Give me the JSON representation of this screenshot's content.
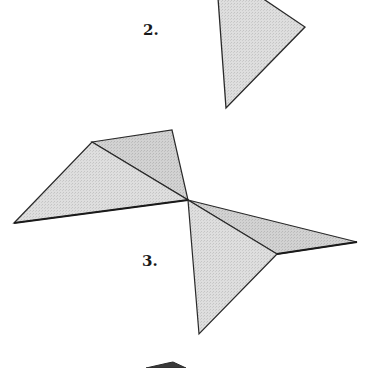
{
  "labels": {
    "figure2": "2.",
    "figure3": "3."
  },
  "colors": {
    "fill": "#dcdcdc",
    "fill_dark": "#cfcfcf",
    "stroke": "#2a2a2a",
    "background": "#ffffff"
  },
  "figures": [
    {
      "id": "figure-2",
      "label": "2.",
      "shape": "triangle",
      "points": [
        [
          218,
          0
        ],
        [
          262,
          0
        ],
        [
          305,
          27
        ],
        [
          226,
          108
        ]
      ]
    },
    {
      "id": "figure-3",
      "label": "3.",
      "shape": "pinwheel-of-triangles",
      "center": [
        188,
        200
      ],
      "triangles": [
        {
          "name": "upper-left-large",
          "points": [
            [
              14,
              223
            ],
            [
              92,
              142
            ],
            [
              188,
              200
            ]
          ]
        },
        {
          "name": "upper-left-small",
          "points": [
            [
              92,
              142
            ],
            [
              172,
              130
            ],
            [
              188,
              200
            ]
          ]
        },
        {
          "name": "lower-right-small",
          "points": [
            [
              188,
              200
            ],
            [
              357,
              242
            ],
            [
              277,
              254
            ]
          ]
        },
        {
          "name": "lower-right-large",
          "points": [
            [
              188,
              200
            ],
            [
              277,
              254
            ],
            [
              199,
              334
            ]
          ]
        }
      ]
    },
    {
      "id": "figure-4-partial",
      "label": "",
      "shape": "partial-cutoff",
      "points": [
        [
          148,
          368
        ],
        [
          170,
          363
        ],
        [
          185,
          368
        ]
      ]
    }
  ]
}
